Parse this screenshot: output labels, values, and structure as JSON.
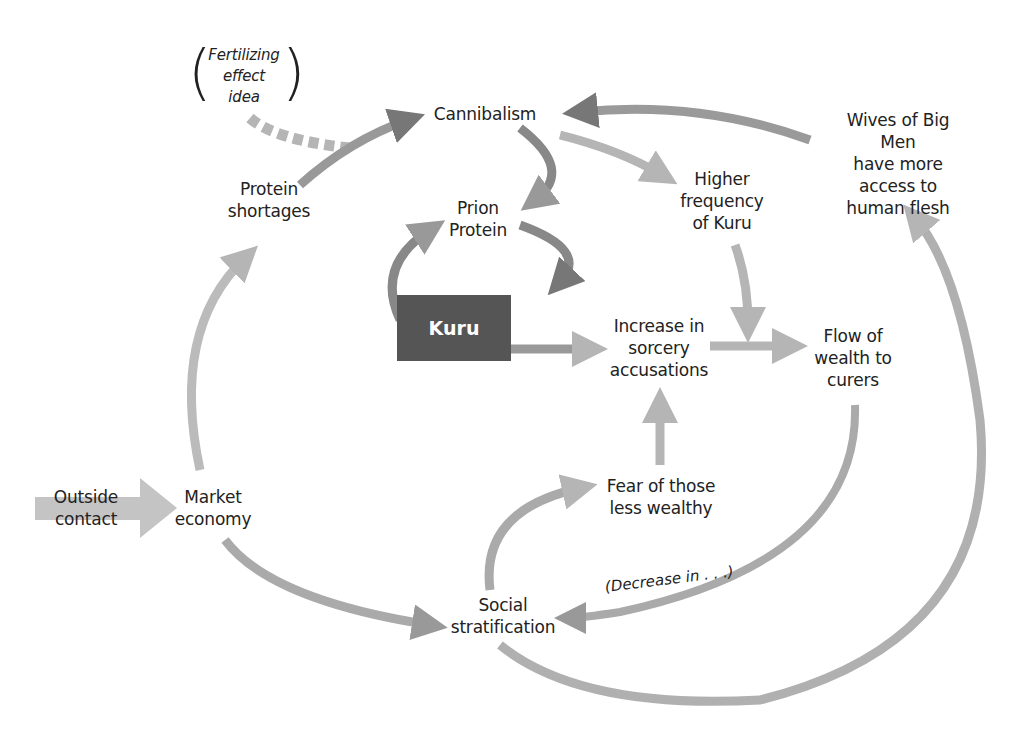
{
  "diagram": {
    "type": "causal-loop",
    "nodes": {
      "fertilizing": "Fertilizing\neffect\nidea",
      "cannibalism": "Cannibalism",
      "wives": "Wives of Big Men\nhave more access to\nhuman  flesh",
      "protein_shortages": "Protein\nshortages",
      "prion": "Prion\nProtein",
      "higher_freq": "Higher\nfrequency\nof Kuru",
      "kuru": "Kuru",
      "increase_sorcery": "Increase in\nsorcery\naccusations",
      "flow_wealth": "Flow of\nwealth to\ncurers",
      "outside_contact": "Outside\ncontact",
      "market_economy": "Market\neconomy",
      "fear": "Fear of those\nless wealthy",
      "social_strat": "Social\nstratification",
      "decrease_label": "(Decrease in . . .)"
    },
    "edges": [
      {
        "from": "Fertilizing effect idea",
        "to": "Cannibalism",
        "style": "dashed"
      },
      {
        "from": "Protein shortages",
        "to": "Cannibalism"
      },
      {
        "from": "Wives of Big Men have more access to human flesh",
        "to": "Cannibalism"
      },
      {
        "from": "Cannibalism",
        "to": "Prion Protein"
      },
      {
        "from": "Cannibalism",
        "to": "Higher frequency of Kuru"
      },
      {
        "from": "Prion Protein",
        "to": "Kuru"
      },
      {
        "from": "Kuru",
        "to": "Prion Protein"
      },
      {
        "from": "Kuru",
        "to": "Increase in sorcery accusations"
      },
      {
        "from": "Higher frequency of Kuru",
        "to": "Flow of wealth to curers"
      },
      {
        "from": "Increase in sorcery accusations",
        "to": "Flow of wealth to curers"
      },
      {
        "from": "Fear of those less wealthy",
        "to": "Increase in sorcery accusations"
      },
      {
        "from": "Flow of wealth to curers",
        "to": "Social stratification",
        "label": "(Decrease in . . .)"
      },
      {
        "from": "Social stratification",
        "to": "Fear of those less wealthy"
      },
      {
        "from": "Social stratification",
        "to": "Wives of Big Men have more access to human flesh"
      },
      {
        "from": "Market economy",
        "to": "Protein shortages"
      },
      {
        "from": "Market economy",
        "to": "Social stratification"
      },
      {
        "from": "Outside contact",
        "to": "Market economy"
      }
    ]
  }
}
